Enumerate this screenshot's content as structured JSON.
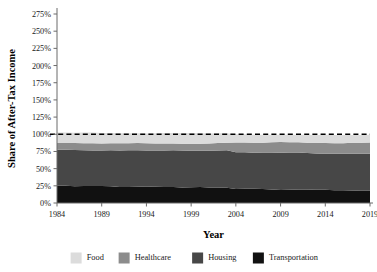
{
  "chart_data": {
    "type": "area",
    "stacked": true,
    "title": "",
    "xlabel": "Year",
    "ylabel": "Share of After-Tax Income",
    "xlim": [
      1984,
      2019
    ],
    "ylim": [
      0,
      275
    ],
    "yunit": "%",
    "grid": false,
    "legend_position": "bottom",
    "xticks": [
      1984,
      1989,
      1994,
      1999,
      2004,
      2009,
      2014,
      2019
    ],
    "xtick_labels": [
      "1984",
      "1989",
      "1994",
      "1999",
      "2004",
      "2009",
      "2014",
      "2019"
    ],
    "yticks": [
      0,
      25,
      50,
      75,
      100,
      125,
      150,
      175,
      200,
      225,
      250,
      275
    ],
    "ytick_labels": [
      "0%",
      "25%",
      "50%",
      "75%",
      "100%",
      "125%",
      "150%",
      "175%",
      "200%",
      "225%",
      "250%",
      "275%"
    ],
    "reference_line": {
      "value": 100,
      "label": "100%",
      "style": "dashed",
      "color": "#000000"
    },
    "x": [
      1984,
      1985,
      1986,
      1987,
      1988,
      1989,
      1990,
      1991,
      1992,
      1993,
      1994,
      1995,
      1996,
      1997,
      1998,
      1999,
      2000,
      2001,
      2002,
      2003,
      2004,
      2005,
      2006,
      2007,
      2008,
      2009,
      2010,
      2011,
      2012,
      2013,
      2014,
      2015,
      2016,
      2017,
      2018,
      2019
    ],
    "series": [
      {
        "name": "Transportation",
        "color": "#111111",
        "values": [
          25.6,
          25.0,
          24.3,
          24.6,
          24.9,
          24.6,
          24.3,
          23.4,
          23.2,
          23.6,
          23.9,
          23.6,
          23.4,
          23.2,
          22.7,
          23.0,
          23.4,
          22.7,
          22.4,
          22.1,
          20.4,
          20.8,
          20.6,
          20.3,
          19.8,
          18.9,
          19.3,
          19.8,
          19.6,
          19.3,
          19.1,
          18.6,
          18.4,
          18.2,
          18.0,
          17.8
        ]
      },
      {
        "name": "Housing",
        "color": "#474747",
        "values": [
          51.9,
          52.4,
          52.8,
          52.1,
          51.6,
          51.9,
          52.4,
          53.1,
          53.4,
          53.1,
          52.6,
          52.8,
          53.1,
          53.4,
          53.6,
          53.1,
          52.6,
          53.4,
          54.1,
          54.6,
          53.4,
          52.9,
          52.6,
          53.1,
          53.6,
          54.3,
          54.1,
          53.6,
          53.1,
          52.8,
          52.6,
          52.9,
          53.1,
          53.4,
          53.6,
          53.9
        ]
      },
      {
        "name": "Healthcare",
        "color": "#8c8c8c",
        "values": [
          9.8,
          9.9,
          10.1,
          10.3,
          10.4,
          10.2,
          10.1,
          10.3,
          10.4,
          10.6,
          10.4,
          10.2,
          10.1,
          9.9,
          9.8,
          10.1,
          10.3,
          10.6,
          10.9,
          11.1,
          14.1,
          14.4,
          14.6,
          14.4,
          14.9,
          15.4,
          15.1,
          14.9,
          15.1,
          15.4,
          15.6,
          15.4,
          15.6,
          15.9,
          16.1,
          16.4
        ]
      },
      {
        "name": "Food",
        "color": "#dcdcdc",
        "values": [
          15.4,
          15.1,
          14.9,
          15.4,
          15.6,
          15.1,
          14.9,
          14.6,
          14.4,
          14.1,
          14.4,
          14.9,
          15.1,
          15.4,
          15.9,
          15.6,
          15.1,
          14.6,
          14.1,
          13.6,
          12.1,
          11.9,
          11.6,
          11.4,
          11.1,
          10.6,
          10.9,
          11.1,
          11.4,
          11.6,
          11.9,
          12.1,
          11.9,
          11.6,
          11.4,
          11.1
        ]
      }
    ]
  },
  "legend": {
    "items": [
      {
        "label": "Food",
        "color": "#dcdcdc"
      },
      {
        "label": "Healthcare",
        "color": "#8c8c8c"
      },
      {
        "label": "Housing",
        "color": "#474747"
      },
      {
        "label": "Transportation",
        "color": "#111111"
      }
    ]
  }
}
